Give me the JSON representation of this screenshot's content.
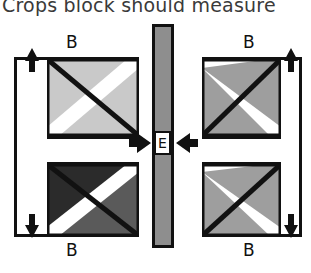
{
  "caption": {
    "text": "Crops block should measure"
  },
  "diagram": {
    "colors": {
      "outline": "#111111",
      "background": "#ffffff",
      "sashing_gray": "#8e8e8e",
      "light_gray": "#c9c9c9",
      "medium_gray": "#9e9e9e",
      "dark_gray": "#5a5a5a",
      "near_black": "#2b2b2b"
    },
    "left_block": {
      "name": "left-block",
      "top_border_label": "B",
      "bottom_border_label": "B",
      "units": [
        {
          "name": "left-upper-unit",
          "diagonal": "top-left-to-bottom-right",
          "upper_fill": "#c9c9c9",
          "lower_fill": "#c9c9c9"
        },
        {
          "name": "left-lower-unit",
          "diagonal": "top-left-to-bottom-right",
          "upper_fill": "#2b2b2b",
          "lower_fill": "#5a5a5a"
        }
      ],
      "height_arrows": {
        "top": "up-arrow",
        "bottom": "down-arrow"
      }
    },
    "right_block": {
      "name": "right-block",
      "top_border_label": "B",
      "bottom_border_label": "B",
      "units": [
        {
          "name": "right-upper-unit",
          "diagonal": "bottom-left-to-top-right",
          "upper_fill": "#9e9e9e",
          "lower_fill": "#9e9e9e"
        },
        {
          "name": "right-lower-unit",
          "diagonal": "bottom-left-to-top-right",
          "upper_fill": "#9e9e9e",
          "lower_fill": "#9e9e9e"
        }
      ],
      "height_arrows": {
        "top": "up-arrow",
        "bottom": "down-arrow"
      }
    },
    "sashing": {
      "name": "center-sashing-strip",
      "label": "E",
      "fill": "#8e8e8e"
    },
    "assembly_arrows": [
      {
        "name": "left-join-arrow",
        "direction": "right"
      },
      {
        "name": "right-join-arrow",
        "direction": "left"
      }
    ]
  }
}
